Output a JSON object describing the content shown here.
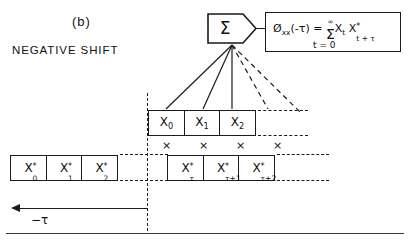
{
  "figure": {
    "panel_label": "(b)",
    "caption": "NEGATIVE SHIFT"
  },
  "summing_junction": {
    "symbol": "Σ",
    "name": "summation"
  },
  "formula": {
    "lhs_fn": "Ø",
    "lhs_sub": "xx",
    "lhs_arg": "(-τ)",
    "equals": "=",
    "sum_symbol": "Σ",
    "sum_upper": "∞",
    "sum_lower": "t = 0",
    "term1_base": "X",
    "term1_sub": "t",
    "term2_base": "X",
    "term2_sup": "*",
    "term2_sub": "t + τ",
    "full_text": "Øxx(-τ) = Σ Xt X*t+τ , t=0 to ∞"
  },
  "rows": {
    "top": {
      "name": "reference-sequence",
      "cells": [
        {
          "base": "X",
          "sub": "0",
          "sup": ""
        },
        {
          "base": "X",
          "sub": "1",
          "sup": ""
        },
        {
          "base": "X",
          "sub": "2",
          "sup": ""
        }
      ]
    },
    "left": {
      "name": "conjugate-sequence-origin",
      "cells": [
        {
          "base": "X",
          "sub": "0",
          "sup": "*"
        },
        {
          "base": "X",
          "sub": "1",
          "sup": "*"
        },
        {
          "base": "X",
          "sub": "2",
          "sup": "*"
        }
      ]
    },
    "right": {
      "name": "conjugate-sequence-shifted",
      "cells": [
        {
          "base": "X",
          "sub": "τ",
          "sup": "*"
        },
        {
          "base": "X",
          "sub": "τ+1",
          "sup": "*"
        },
        {
          "base": "X",
          "sub": "τ+2",
          "sup": "*"
        }
      ]
    }
  },
  "multiply_row": {
    "symbols": [
      "×",
      "×",
      "×",
      "×"
    ]
  },
  "shift_axis": {
    "label": "−τ",
    "direction": "left"
  },
  "colors": {
    "ink": "#1a1a1a",
    "background": "#ffffff",
    "rule": "#3a3a3a"
  }
}
